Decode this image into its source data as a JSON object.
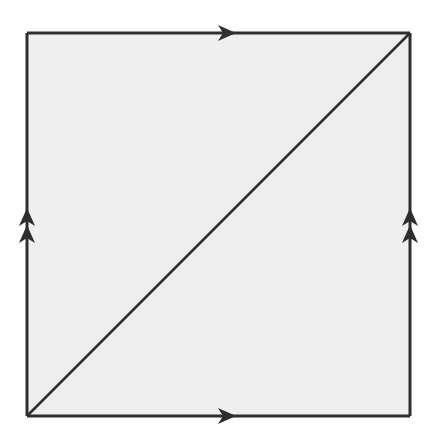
{
  "diagram": {
    "colors": {
      "fill": "#efefef",
      "stroke": "#2e2e2e",
      "background": "#ffffff"
    },
    "square": {
      "x1": 27,
      "y1": 33,
      "x2": 410,
      "y2": 416
    },
    "edges": [
      {
        "name": "top-edge",
        "arrow": "single",
        "direction": "right"
      },
      {
        "name": "bottom-edge",
        "arrow": "single",
        "direction": "right"
      },
      {
        "name": "left-edge",
        "arrow": "double",
        "direction": "up"
      },
      {
        "name": "right-edge",
        "arrow": "double",
        "direction": "up"
      }
    ],
    "diagonal": {
      "from": "bottom-left",
      "to": "top-right"
    }
  }
}
